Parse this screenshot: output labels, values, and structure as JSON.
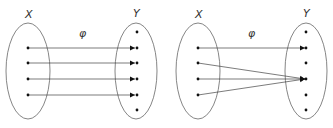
{
  "diagrams": [
    {
      "name": "injective-map",
      "domain_label": "X",
      "codomain_label": "Y",
      "map_label": "φ",
      "domain_points": 4,
      "codomain_points": 6,
      "mapping": [
        [
          0,
          1
        ],
        [
          1,
          2
        ],
        [
          2,
          3
        ],
        [
          3,
          4
        ]
      ]
    },
    {
      "name": "non-injective-map",
      "domain_label": "X",
      "codomain_label": "Y",
      "map_label": "φ",
      "domain_points": 4,
      "codomain_points": 6,
      "mapping": [
        [
          0,
          1
        ],
        [
          1,
          3
        ],
        [
          2,
          3
        ],
        [
          3,
          3
        ]
      ]
    }
  ],
  "colors": {
    "stroke": "#555555",
    "dot": "#111111",
    "text": "#333333"
  }
}
